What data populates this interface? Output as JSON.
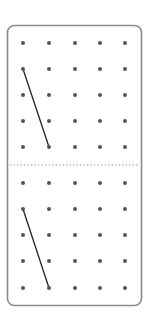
{
  "figure": {
    "width": 150,
    "height": 323,
    "frame": {
      "x": 7.5,
      "y": 25.5,
      "width": 134,
      "height": 280,
      "radius": 7,
      "stroke": "#8a8a8a"
    },
    "divider": {
      "y": 165,
      "x1": 10,
      "x2": 139,
      "stroke": "#9a9a9a",
      "style": "dotted"
    },
    "dot_color": "#555555",
    "line_color": "#222222",
    "panels": [
      {
        "name": "top-geoboard",
        "columns_x": [
          23,
          49,
          75,
          100,
          125
        ],
        "rows_y": [
          43,
          69,
          95,
          121,
          147
        ],
        "segment": {
          "from": [
            0,
            1
          ],
          "to": [
            1,
            4
          ]
        }
      },
      {
        "name": "bottom-geoboard",
        "columns_x": [
          23,
          49,
          75,
          100,
          125
        ],
        "rows_y": [
          183,
          209,
          235,
          261,
          288
        ],
        "segment": {
          "from": [
            0,
            1
          ],
          "to": [
            1,
            4
          ]
        }
      }
    ]
  }
}
